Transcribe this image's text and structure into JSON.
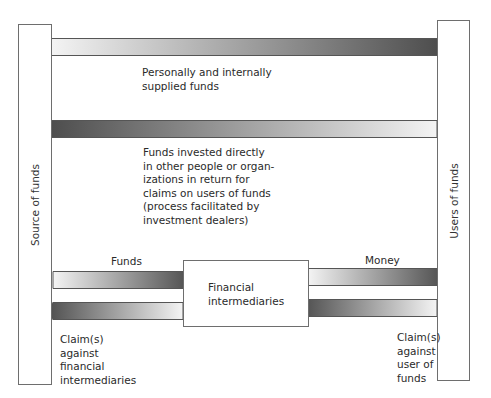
{
  "diagram": {
    "nodes": {
      "source": {
        "label": "Source of funds"
      },
      "users": {
        "label": "Users of funds"
      },
      "intermediaries": {
        "label_line1": "Financial",
        "label_line2": "intermediaries"
      }
    },
    "flows": {
      "direct_personal": {
        "direction": "source-to-users",
        "line1": "Personally and internally",
        "line2": "supplied funds"
      },
      "direct_investment": {
        "direction": "users-to-source",
        "line1": "Funds invested directly",
        "line2": "in other people or organ-",
        "line3": "izations in return for",
        "line4": "claims on users of funds",
        "line5": "(process facilitated by",
        "line6": "investment dealers)"
      },
      "funds_to_intermediaries": {
        "direction": "source-to-intermediaries",
        "label": "Funds"
      },
      "claims_on_intermediaries": {
        "direction": "intermediaries-to-source",
        "line1": "Claim(s)",
        "line2": "against",
        "line3": "financial",
        "line4": "intermediaries"
      },
      "money_to_users": {
        "direction": "intermediaries-to-users",
        "label": "Money"
      },
      "claims_on_users": {
        "direction": "users-to-intermediaries",
        "line1": "Claim(s)",
        "line2": "against",
        "line3": "user of",
        "line4": "funds"
      }
    },
    "colors": {
      "arrow_dark": "#4a4a4a",
      "arrow_light": "#f2f2f2",
      "box_border": "#6e6e6e"
    }
  }
}
